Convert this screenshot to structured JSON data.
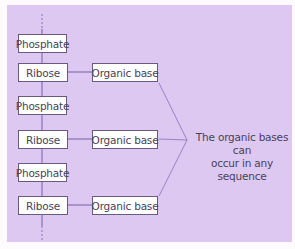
{
  "diagram": {
    "colors": {
      "panel_background": "#ddc8f2",
      "line": "#8a6fb5",
      "box_border": "#6a5a82",
      "text": "#4a4258"
    },
    "backbone": [
      {
        "type": "phosphate",
        "label": "Phosphate"
      },
      {
        "type": "sugar",
        "label": "Ribose",
        "base": "Organic base"
      },
      {
        "type": "phosphate",
        "label": "Phosphate"
      },
      {
        "type": "sugar",
        "label": "Ribose",
        "base": "Organic base"
      },
      {
        "type": "phosphate",
        "label": "Phosphate"
      },
      {
        "type": "sugar",
        "label": "Ribose",
        "base": "Organic base"
      }
    ],
    "annotation": {
      "line1": "The organic bases can",
      "line2": "occur in any sequence"
    }
  }
}
